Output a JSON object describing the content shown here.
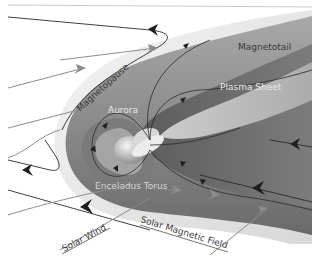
{
  "labels": {
    "magnetotail": "Magnetotail",
    "magnetopause": "Magnetopause",
    "aurora": "Aurora",
    "plasma_sheet": "Plasma Sheet",
    "enceladus_torus": "Enceladus Torus",
    "solar_wind": "Solar Wind",
    "solar_magnetic_field": "Solar Magnetic Field"
  },
  "colors": {
    "background": "#ffffff",
    "magnetosheath": "#e6e6e6",
    "magnetosphere_outer": "#9a9a9a",
    "magnetosphere_inner": "#6f6f6f",
    "plasma_sheet": "#c8c8c8",
    "field_line_dark": "#2a2a2a",
    "solar_wind_arrow": "#8c8c8c"
  }
}
